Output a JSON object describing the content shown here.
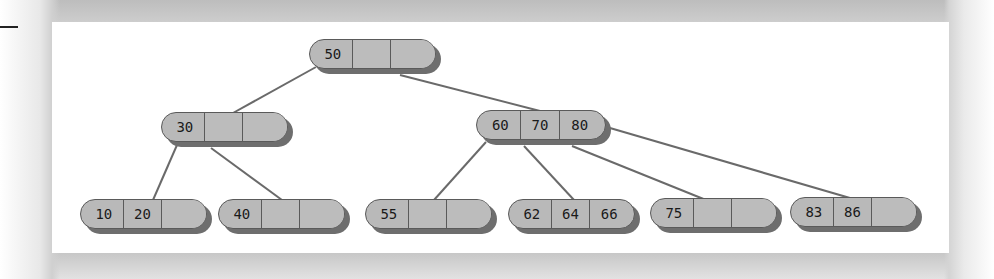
{
  "diagram": {
    "type": "b-tree (2-3-4 tree)",
    "colors": {
      "panel": "#ffffff",
      "node_fill": "#b9b9b9",
      "node_border": "#5a5a5a",
      "node_shadow": "#6e6e6e",
      "link": "#6a6a6a"
    },
    "nodes": {
      "root": {
        "keys": [
          "50",
          "",
          ""
        ]
      },
      "n30": {
        "keys": [
          "30",
          "",
          ""
        ]
      },
      "n60": {
        "keys": [
          "60",
          "70",
          "80"
        ]
      },
      "leaf1": {
        "keys": [
          "10",
          "20",
          ""
        ]
      },
      "leaf2": {
        "keys": [
          "40",
          "",
          ""
        ]
      },
      "leaf3": {
        "keys": [
          "55",
          "",
          ""
        ]
      },
      "leaf4": {
        "keys": [
          "62",
          "64",
          "66"
        ]
      },
      "leaf5": {
        "keys": [
          "75",
          "",
          ""
        ]
      },
      "leaf6": {
        "keys": [
          "83",
          "86",
          ""
        ]
      }
    },
    "edges": [
      [
        "root",
        "n30"
      ],
      [
        "root",
        "n60"
      ],
      [
        "n30",
        "leaf1"
      ],
      [
        "n30",
        "leaf2"
      ],
      [
        "n60",
        "leaf3"
      ],
      [
        "n60",
        "leaf4"
      ],
      [
        "n60",
        "leaf5"
      ],
      [
        "n60",
        "leaf6"
      ]
    ]
  }
}
